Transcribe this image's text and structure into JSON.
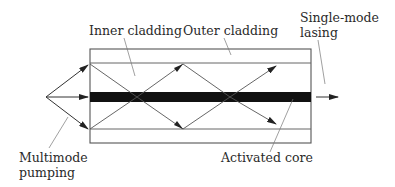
{
  "diagram": {
    "labels": {
      "inner_cladding": "Inner cladding",
      "outer_cladding": "Outer cladding",
      "single_mode_line1": "Single-mode",
      "single_mode_line2": "lasing",
      "multimode_line1": "Multimode",
      "multimode_line2": "pumping",
      "activated_core": "Activated core"
    },
    "colors": {
      "line": "#555555",
      "core": "#111111",
      "text": "#2a2a2a"
    }
  }
}
